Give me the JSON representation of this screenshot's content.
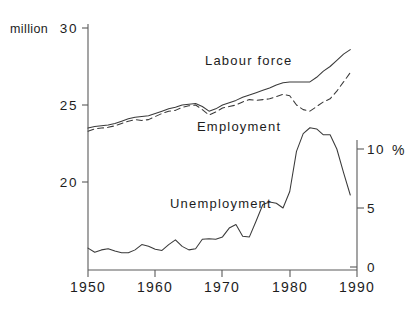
{
  "chart_data": {
    "type": "line",
    "title": "",
    "subtitle": "",
    "xlabel": "",
    "ylabel": "million",
    "y2label": "%",
    "grid": false,
    "legend_position": "inline-annotations",
    "x": [
      1950,
      1951,
      1952,
      1953,
      1954,
      1955,
      1956,
      1957,
      1958,
      1959,
      1960,
      1961,
      1962,
      1963,
      1964,
      1965,
      1966,
      1967,
      1968,
      1969,
      1970,
      1971,
      1972,
      1973,
      1974,
      1975,
      1976,
      1977,
      1978,
      1979,
      1980,
      1981,
      1982,
      1983,
      1984,
      1985,
      1986,
      1987,
      1988,
      1989
    ],
    "xlim": [
      1950,
      1990
    ],
    "xticks": [
      1950,
      1960,
      1970,
      1980,
      1990
    ],
    "xtick_labels": [
      "1950",
      "1960",
      "1970",
      "1980",
      "1990"
    ],
    "ylim": [
      16.6,
      30
    ],
    "yticks": [
      20,
      25,
      30
    ],
    "ytick_labels": [
      "20",
      "25",
      "30"
    ],
    "y2lim": [
      0,
      13.2
    ],
    "y2ticks": [
      0,
      5,
      10
    ],
    "y2tick_labels": [
      "0",
      "5",
      "10"
    ],
    "series": [
      {
        "name": "Labour force",
        "axis": "left",
        "style": "solid",
        "unit": "million",
        "values": [
          23.5,
          23.6,
          23.65,
          23.7,
          23.8,
          23.95,
          24.1,
          24.2,
          24.25,
          24.3,
          24.45,
          24.6,
          24.75,
          24.85,
          25.0,
          25.05,
          25.1,
          24.9,
          24.6,
          24.75,
          25.0,
          25.15,
          25.3,
          25.5,
          25.65,
          25.8,
          25.95,
          26.1,
          26.3,
          26.45,
          26.5,
          26.5,
          26.5,
          26.5,
          26.8,
          27.2,
          27.5,
          27.9,
          28.3,
          28.6
        ]
      },
      {
        "name": "Employment",
        "axis": "left",
        "style": "dashed",
        "unit": "million",
        "values": [
          23.3,
          23.45,
          23.5,
          23.55,
          23.65,
          23.8,
          23.95,
          24.05,
          24.0,
          24.05,
          24.25,
          24.45,
          24.6,
          24.65,
          24.85,
          24.95,
          25.0,
          24.7,
          24.35,
          24.55,
          24.8,
          24.9,
          25.0,
          25.2,
          25.35,
          25.3,
          25.35,
          25.4,
          25.55,
          25.7,
          25.6,
          25.0,
          24.7,
          24.6,
          24.9,
          25.2,
          25.4,
          25.9,
          26.5,
          27.1
        ]
      },
      {
        "name": "Unemployment",
        "axis": "right",
        "style": "solid",
        "unit": "%",
        "values": [
          1.6,
          1.25,
          1.45,
          1.55,
          1.35,
          1.2,
          1.2,
          1.45,
          1.9,
          1.75,
          1.5,
          1.4,
          1.9,
          2.3,
          1.75,
          1.45,
          1.55,
          2.35,
          2.4,
          2.35,
          2.55,
          3.3,
          3.6,
          2.6,
          2.55,
          3.9,
          5.3,
          5.5,
          5.4,
          5.0,
          6.4,
          9.8,
          11.3,
          11.8,
          11.7,
          11.2,
          11.2,
          10.0,
          8.0,
          6.1
        ]
      }
    ],
    "annotations": [
      {
        "name": "labour-force-label",
        "text": "Labour force",
        "x": 1974.5,
        "y_px": 65
      },
      {
        "name": "employment-label",
        "text": "Employment",
        "x": 1968.5,
        "y_px": 127
      },
      {
        "name": "unemployment-label",
        "text": "Unemployment",
        "x": 1965.5,
        "y_px": 205
      }
    ],
    "axis_unit_labels": {
      "left_unit": "million",
      "right_unit": "%"
    },
    "colors": {
      "line": "#3a3a3a",
      "axis": "#5a5a5a",
      "text": "#1d1d1d",
      "background": "#ffffff"
    }
  }
}
